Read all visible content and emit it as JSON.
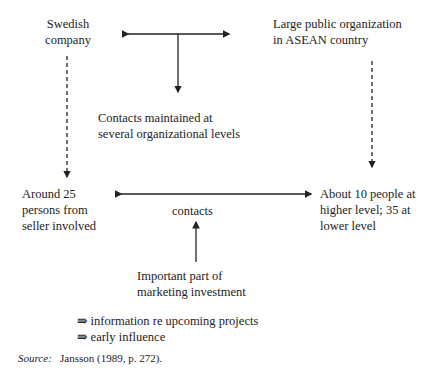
{
  "nodes": {
    "swedish_company": "Swedish\ncompany",
    "asean_org": "Large public organization\nin ASEAN country",
    "contacts_levels": "Contacts maintained at\nseveral organizational levels",
    "seller_persons": "Around 25\npersons from\nseller involved",
    "buyer_people": "About 10 people at\nhigher level; 35 at\nlower level",
    "contacts": "contacts",
    "marketing_investment": "Important part of\nmarketing investment"
  },
  "outcomes": [
    {
      "symbol": "⇛",
      "text": "information re upcoming projects"
    },
    {
      "symbol": "⇛",
      "text": "early influence"
    }
  ],
  "source": {
    "label": "Source:",
    "text": "Jansson (1989, p. 272)."
  },
  "colors": {
    "line": "#222222",
    "text": "#222222",
    "background": "#ffffff"
  }
}
